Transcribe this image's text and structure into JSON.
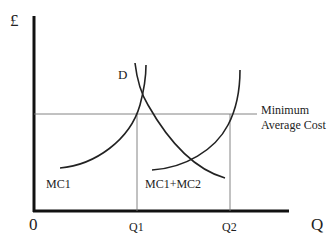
{
  "diagram": {
    "axes": {
      "y_label": "£",
      "x_label": "Q",
      "origin_label": "0"
    },
    "ticks": {
      "q1": "Q1",
      "q2": "Q2"
    },
    "curves": {
      "demand": "D",
      "mc1": "MC1",
      "mc_combined": "MC1+MC2"
    },
    "reference_line": {
      "line1": "Minimum",
      "line2": "Average Cost"
    },
    "colors": {
      "axis": "#111111",
      "curve": "#222222",
      "guide": "#666666"
    }
  }
}
